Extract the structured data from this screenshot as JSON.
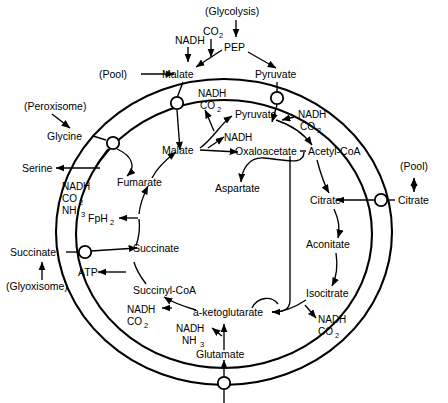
{
  "diagram": {
    "colors": {
      "stroke": "#000000",
      "background": "#ffffff"
    },
    "external": {
      "glycolysis": "(Glycolysis)",
      "pep": "PEP",
      "pep_inputs": {
        "nadh": "NADH",
        "co2": "CO",
        "co2_sub": "2"
      },
      "pool_left": "(Pool)",
      "malate_out": "Malate",
      "pyruvate_out": "Pyruvate",
      "peroxisome": "(Peroxisome)",
      "glycine": "Glycine",
      "serine": "Serine",
      "succinate_out": "Succinate",
      "glyoxisome": "(Glyoxisome)",
      "pool_right": "(Pool)",
      "citrate_out": "Citrate"
    },
    "matrix": {
      "malate": "Malate",
      "pyruvate": "Pyruvate",
      "oxaloacetate": "Oxaloacetate",
      "aspartate": "Aspartate",
      "acetyl_coa": "Acetyl-CoA",
      "citrate": "Citrate",
      "aconitate": "Aconitate",
      "isocitrate": "Isocitrate",
      "ketoglutarate": "a-ketoglutarate",
      "glutamate": "Glutamate",
      "succinyl_coa": "Succinyl-CoA",
      "succinate": "Succinate",
      "fumarate": "Fumarate",
      "atp": "ATP",
      "fph2": "FpH",
      "fph2_sub": "2"
    },
    "cofactors": {
      "nadh": "NADH",
      "co2": "CO",
      "co2_sub": "2",
      "nh3": "NH",
      "nh3_sub": "3"
    },
    "cofactor_groups": [
      {
        "id": "malate-to-pyruvate",
        "items": [
          "NADH",
          "CO2"
        ]
      },
      {
        "id": "pyruvate-to-acetyl-coa",
        "items": [
          "NADH",
          "CO2"
        ]
      },
      {
        "id": "malate-to-oxaloacetate",
        "items": [
          "NADH"
        ]
      },
      {
        "id": "glycine-to-serine",
        "items": [
          "NADH",
          "CO2",
          "NH3"
        ]
      },
      {
        "id": "isocitrate-to-ketoglutarate",
        "items": [
          "NADH",
          "CO2"
        ]
      },
      {
        "id": "ketoglutarate-to-succinyl-coa",
        "items": [
          "NADH",
          "CO2"
        ]
      },
      {
        "id": "glutamate-to-ketoglutarate",
        "items": [
          "NADH",
          "NH3"
        ]
      }
    ],
    "transporters": [
      {
        "id": "malate-porter",
        "metabolite": "Malate"
      },
      {
        "id": "pyruvate-porter",
        "metabolite": "Pyruvate"
      },
      {
        "id": "glycine-serine-porter",
        "metabolite": "Glycine/Serine"
      },
      {
        "id": "succinate-porter",
        "metabolite": "Succinate"
      },
      {
        "id": "citrate-porter",
        "metabolite": "Citrate"
      },
      {
        "id": "bottom-porter",
        "metabolite": "Glutamate"
      }
    ]
  }
}
